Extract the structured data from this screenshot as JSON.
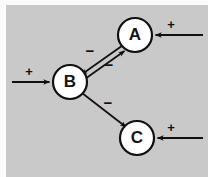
{
  "figure": {
    "background_color": "#c9c9c9",
    "stroke_color": "#101010",
    "node_fill_color": "#ffffff",
    "width": 208,
    "height": 177
  },
  "diagram": {
    "type": "signed-digraph",
    "nodes": [
      {
        "id": "A",
        "label": "A",
        "cx": 135,
        "cy": 35,
        "r": 17
      },
      {
        "id": "B",
        "label": "B",
        "cx": 70,
        "cy": 82,
        "r": 17
      },
      {
        "id": "C",
        "label": "C",
        "cx": 137,
        "cy": 138,
        "r": 17
      }
    ],
    "edges": [
      {
        "id": "A-to-B",
        "from": "A",
        "to": "B",
        "sign": "−",
        "label_x": 90,
        "label_y": 49
      },
      {
        "id": "B-to-A",
        "from": "B",
        "to": "A",
        "sign": "−",
        "label_x": 109,
        "label_y": 63
      },
      {
        "id": "B-to-C",
        "from": "B",
        "to": "C",
        "sign": "−",
        "label_x": 108,
        "label_y": 101
      }
    ],
    "inputs": [
      {
        "id": "input-to-A",
        "target": "A",
        "sign": "+",
        "label_x": 171,
        "label_y": 24,
        "line_y": 35,
        "from_x": 203,
        "to_x": 153
      },
      {
        "id": "input-to-B",
        "target": "B",
        "sign": "+",
        "label_x": 29,
        "label_y": 71,
        "line_y": 82,
        "from_x": 12,
        "to_x": 51
      },
      {
        "id": "input-to-C",
        "target": "C",
        "sign": "+",
        "label_x": 171,
        "label_y": 127,
        "line_y": 138,
        "from_x": 203,
        "to_x": 155
      }
    ]
  }
}
